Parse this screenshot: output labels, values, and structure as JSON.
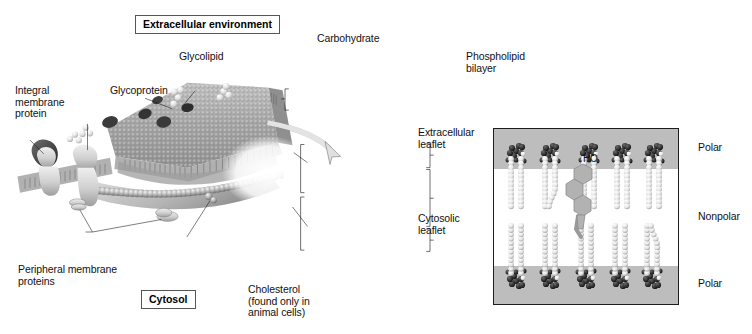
{
  "figure": {
    "title_boxes": {
      "extracellular": "Extracellular environment",
      "cytosol": "Cytosol"
    },
    "labels": {
      "integral_membrane_protein": "Integral\nmembrane\nprotein",
      "glycoprotein": "Glycoprotein",
      "glycolipid": "Glycolipid",
      "carbohydrate": "Carbohydrate",
      "phospholipid_bilayer": "Phospholipid\nbilayer",
      "extracellular_leaflet": "Extracellular\nleaflet",
      "cytosolic_leaflet": "Cytosolic\nleaflet",
      "peripheral_membrane_proteins": "Peripheral membrane\nproteins",
      "cholesterol": "Cholesterol\n(found only in\nanimal cells)",
      "hydroxyl_group": "HO"
    },
    "inset_region_labels": {
      "polar_top": "Polar",
      "nonpolar": "Nonpolar",
      "polar_bottom": "Polar"
    },
    "colors": {
      "polar_band": "#bdbdbd",
      "nonpolar_band": "#ffffff",
      "inset_border": "#1d1d1d",
      "head_group_dark": "#2b2b2b",
      "tail_light": "#e8e8e8",
      "text": "#111111",
      "membrane_gray": "#9a9a9a",
      "protein_light": "#d8d8d8",
      "protein_dark": "#4a4a4a",
      "cholesterol_gray": "#a8a8a8",
      "background": "#ffffff"
    }
  }
}
